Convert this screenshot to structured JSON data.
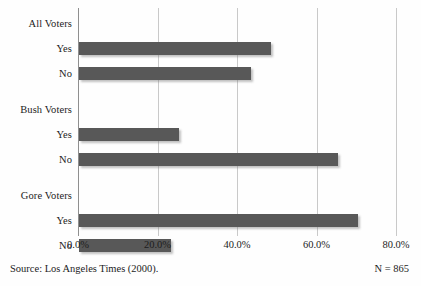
{
  "chart_data": {
    "type": "bar",
    "orientation": "horizontal",
    "title": "",
    "xlabel": "",
    "ylabel": "",
    "xlim": [
      0,
      80
    ],
    "xticks": [
      "0.0%",
      "20.0%",
      "40.0%",
      "60.0%",
      "80.0%"
    ],
    "xtick_values": [
      0,
      20,
      40,
      60,
      80
    ],
    "grid": true,
    "legend": false,
    "bar_color": "#585858",
    "gridline_color": "#c9c9c9",
    "axis_color": "#8f8f8f",
    "groups": [
      {
        "name": "All Voters",
        "bars": [
          {
            "label": "Yes",
            "value": 48.3
          },
          {
            "label": "No",
            "value": 43.3
          }
        ]
      },
      {
        "name": "Bush Voters",
        "bars": [
          {
            "label": "Yes",
            "value": 25.2
          },
          {
            "label": "No",
            "value": 65.2
          }
        ]
      },
      {
        "name": "Gore Voters",
        "bars": [
          {
            "label": "Yes",
            "value": 70.2
          },
          {
            "label": "No",
            "value": 23.1
          }
        ]
      }
    ],
    "categories": [
      "All Voters",
      "All Voters - Yes",
      "All Voters - No",
      "Bush Voters",
      "Bush Voters - Yes",
      "Bush Voters - No",
      "Gore Voters",
      "Gore Voters - Yes",
      "Gore Voters - No"
    ],
    "values": [
      null,
      48.3,
      43.3,
      null,
      25.2,
      65.2,
      null,
      70.2,
      23.1
    ],
    "annotations": {
      "source": "Source: Los Angeles Times (2000).",
      "sample_size": "N = 865"
    }
  },
  "footer": {
    "source": "Source: Los Angeles Times (2000).",
    "sample_size": "N = 865"
  }
}
